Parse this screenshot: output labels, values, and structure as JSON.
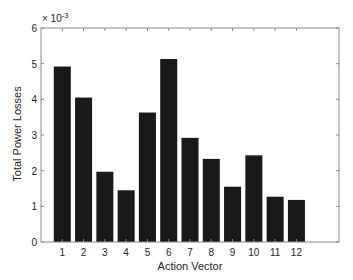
{
  "chart_data": {
    "type": "bar",
    "title": "",
    "xlabel": "Action Vector",
    "ylabel": "Total Power Losses",
    "y_exponent_label": "× 10",
    "y_exponent_power": "-3",
    "categories": [
      "1",
      "2",
      "3",
      "4",
      "5",
      "6",
      "7",
      "8",
      "9",
      "10",
      "11",
      "12"
    ],
    "values": [
      4.92,
      4.05,
      1.97,
      1.45,
      3.63,
      5.13,
      2.92,
      2.33,
      1.55,
      2.43,
      1.27,
      1.18
    ],
    "value_scale": 0.001,
    "xlim": [
      0,
      14
    ],
    "ylim": [
      0,
      6
    ],
    "yticks": [
      0,
      1,
      2,
      3,
      4,
      5,
      6
    ],
    "xticks": [
      1,
      2,
      3,
      4,
      5,
      6,
      7,
      8,
      9,
      10,
      11,
      12
    ],
    "grid": false,
    "legend": null,
    "colors": {
      "bar": "#191919",
      "axis": "#8a8a8a",
      "text": "#262626",
      "background": "#ffffff"
    }
  }
}
